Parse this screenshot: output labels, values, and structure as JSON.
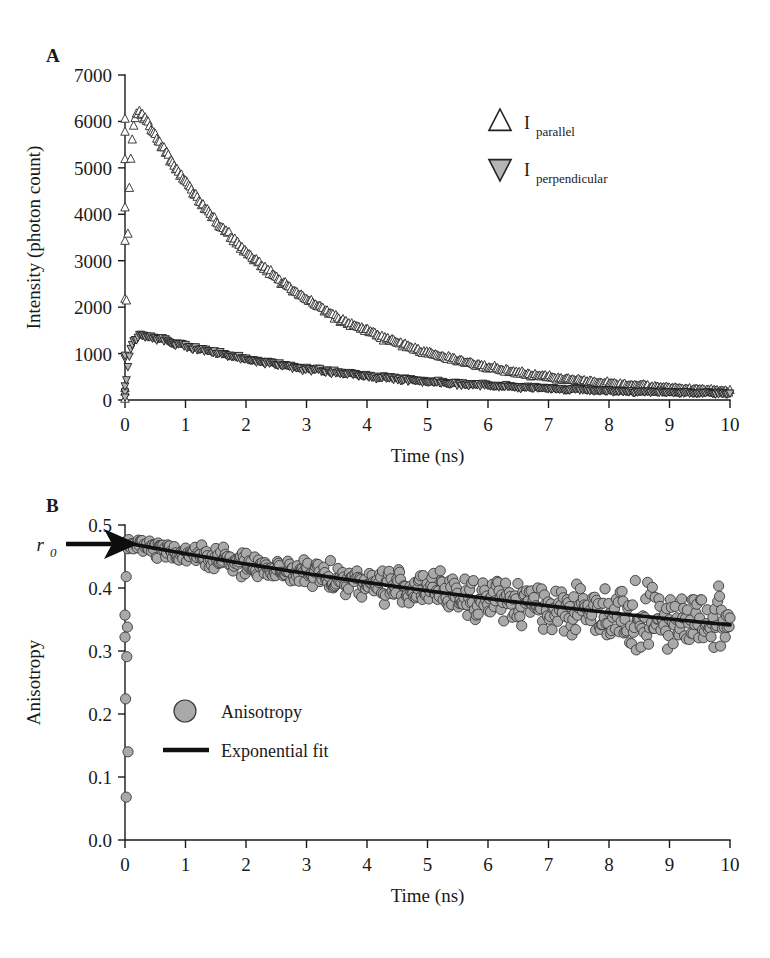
{
  "figure": {
    "panels": [
      {
        "letter": "A",
        "xlabel": "Time (ns)",
        "ylabel": "Intensity (photon count)"
      },
      {
        "letter": "B",
        "xlabel": "Time (ns)",
        "ylabel": "Anisotropy"
      }
    ],
    "annotation": {
      "r0_label": "r",
      "r0_subscript": "0"
    }
  },
  "chart_data": [
    {
      "type": "scatter",
      "panel": "A",
      "title": "",
      "xlabel": "Time (ns)",
      "ylabel": "Intensity (photon count)",
      "xlim": [
        0,
        10
      ],
      "ylim": [
        0,
        7000
      ],
      "xticks": [
        0,
        1,
        2,
        3,
        4,
        5,
        6,
        7,
        8,
        9,
        10
      ],
      "yticks": [
        0,
        1000,
        2000,
        3000,
        4000,
        5000,
        6000,
        7000
      ],
      "xtick_labels": [
        "0",
        "1",
        "2",
        "3",
        "4",
        "5",
        "6",
        "7",
        "8",
        "9",
        "10"
      ],
      "ytick_labels": [
        "0",
        "1000",
        "2000",
        "3000",
        "4000",
        "5000",
        "6000",
        "7000"
      ],
      "grid": false,
      "legend_position": "upper-right",
      "series": [
        {
          "name": "I_parallel",
          "label": "I",
          "sublabel": "parallel",
          "marker": "triangle-up-open",
          "marker_fill": "#ffffff",
          "marker_stroke": "#2a2a2a",
          "peak_value": 6450,
          "peak_time": 0.18,
          "rise_tau": 0.06,
          "decay_tau": 2.55,
          "noise": 70,
          "baseline": 60,
          "n_points": 420,
          "startup_points": [
            {
              "t": 0.0,
              "y": 180
            },
            {
              "t": 0.0,
              "y": 260
            },
            {
              "t": 0.0,
              "y": 2180
            },
            {
              "t": 0.0,
              "y": 3430
            },
            {
              "t": 0.0,
              "y": 4150
            },
            {
              "t": 0.0,
              "y": 5190
            },
            {
              "t": 0.0,
              "y": 5780
            },
            {
              "t": 0.0,
              "y": 6060
            }
          ]
        },
        {
          "name": "I_perpendicular",
          "label": "I",
          "sublabel": "perpendicular",
          "marker": "triangle-down-filled",
          "marker_fill": "#b4b4b4",
          "marker_stroke": "#1d1d1d",
          "peak_value": 1420,
          "peak_time": 0.28,
          "rise_tau": 0.07,
          "decay_tau": 3.45,
          "noise": 42,
          "baseline": 55,
          "n_points": 420,
          "startup_points": [
            {
              "t": 0.0,
              "y": 170
            },
            {
              "t": 0.0,
              "y": 300
            },
            {
              "t": 0.0,
              "y": 900
            },
            {
              "t": 0.0,
              "y": 960
            }
          ]
        }
      ]
    },
    {
      "type": "scatter",
      "panel": "B",
      "title": "",
      "xlabel": "Time (ns)",
      "ylabel": "Anisotropy",
      "xlim": [
        0,
        10
      ],
      "ylim": [
        0.0,
        0.5
      ],
      "xticks": [
        0,
        1,
        2,
        3,
        4,
        5,
        6,
        7,
        8,
        9,
        10
      ],
      "yticks": [
        0.0,
        0.1,
        0.2,
        0.3,
        0.4,
        0.5
      ],
      "xtick_labels": [
        "0",
        "1",
        "2",
        "3",
        "4",
        "5",
        "6",
        "7",
        "8",
        "9",
        "10"
      ],
      "ytick_labels": [
        "0.0",
        "0.1",
        "0.2",
        "0.3",
        "0.4",
        "0.5"
      ],
      "grid": false,
      "legend_position": "lower-left",
      "r0_value": 0.47,
      "series": [
        {
          "name": "Anisotropy",
          "label": "Anisotropy",
          "marker": "circle",
          "marker_fill": "#a9a9a9",
          "marker_stroke": "#3a3a3a",
          "n_points": 640,
          "r0": 0.472,
          "r_inf": 0.21,
          "decay_tau": 14.5,
          "noise_start": 0.012,
          "noise_end": 0.055,
          "outlier_points": [
            {
              "t": 0.02,
              "y": 0.418
            },
            {
              "t": 0.0,
              "y": 0.357
            },
            {
              "t": 0.04,
              "y": 0.338
            },
            {
              "t": 0.0,
              "y": 0.322
            },
            {
              "t": 0.03,
              "y": 0.291
            },
            {
              "t": 0.01,
              "y": 0.224
            },
            {
              "t": 0.05,
              "y": 0.14
            },
            {
              "t": 0.02,
              "y": 0.068
            }
          ]
        },
        {
          "name": "Exponential fit",
          "label": "Exponential fit",
          "marker": "line",
          "stroke": "#111111",
          "start_value": 0.472,
          "end_value": 0.243
        }
      ]
    }
  ]
}
